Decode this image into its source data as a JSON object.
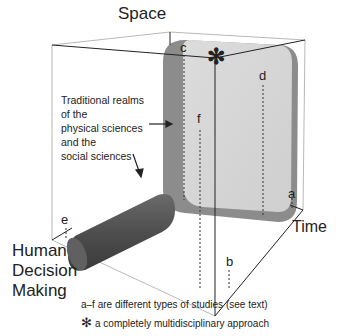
{
  "axes": {
    "space": "Space",
    "time": "Time",
    "human_decision_making": [
      "Human",
      "Decision",
      "Making"
    ]
  },
  "annotation": {
    "lines": [
      "Traditional realms",
      "of the",
      "physical sciences",
      "and the",
      "social sciences"
    ]
  },
  "study_labels": {
    "a": "a",
    "b": "b",
    "c": "c",
    "d": "d",
    "e": "e",
    "f": "f"
  },
  "center_marker": "✻",
  "legend": {
    "line1": "a–f are different types of studies (see text)",
    "line2_symbol": "✻",
    "line2": "a completely multidisciplinary approach"
  },
  "colors": {
    "slab_face": "#d3d3d3",
    "slab_side": "#8a8a8a",
    "cylinder": "#5a5a5a",
    "lines": "#222222"
  }
}
